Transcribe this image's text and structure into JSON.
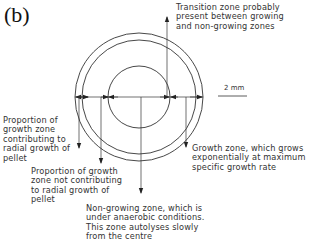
{
  "figure": {
    "panel_label": "(b)",
    "scale_bar": {
      "label": "2 mm"
    },
    "annotations": {
      "transition_zone": "Transition zone probably\npresent between growing\nand non-growing zones",
      "growth_contributing": "Proportion of\ngrowth zone\ncontributing to\nradial growth of\npellet",
      "growth_not_contributing": "Proportion of growth\nzone not contributing\nto radial growth of\npellet",
      "growth_zone": "Growth zone, which grows\nexponentially at maximum\nspecific growth rate",
      "non_growing_zone": "Non-growing zone, which is\nunder anaerobic conditions.\nThis zone autolyses slowly\nfrom the centre"
    },
    "colors": {
      "line": "#333333",
      "text": "#333333",
      "background": "#ffffff"
    }
  }
}
